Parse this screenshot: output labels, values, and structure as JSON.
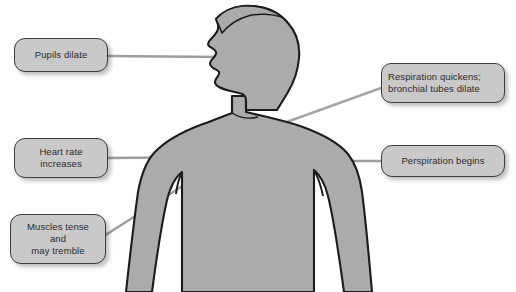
{
  "diagram": {
    "figure": {
      "name": "human-body-silhouette",
      "fill_color": "#ababab",
      "outline_color": "#1a1a1a",
      "description": "Gray silhouette of a human head and torso in left-facing profile"
    },
    "background_color": "#ffffff",
    "callout_fill_color": "#c9c9c9",
    "callout_border_color": "#3d3d3d",
    "connector_color": "#9a9a9a",
    "callouts": [
      {
        "id": "pupils",
        "label": "Pupils dilate",
        "side": "left",
        "align": "center",
        "connector": "horizontal-line-to-face"
      },
      {
        "id": "heart",
        "label": "Heart rate\nincreases",
        "side": "left",
        "align": "center",
        "connector": "horizontal-line-to-chest"
      },
      {
        "id": "muscles",
        "label": "Muscles tense\nand\nmay tremble",
        "side": "left",
        "align": "center",
        "connector": "diagonal-line-to-arm"
      },
      {
        "id": "respiration",
        "label": "Respiration quickens;\nbronchial tubes dilate",
        "side": "right",
        "align": "left",
        "connector": "diagonal-line-to-chest"
      },
      {
        "id": "perspiration",
        "label": "Perspiration begins",
        "side": "right",
        "align": "center",
        "connector": "horizontal-line-to-arm"
      }
    ]
  }
}
